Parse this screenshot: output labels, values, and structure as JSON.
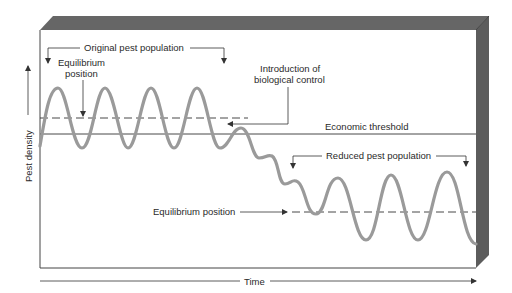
{
  "diagram": {
    "type": "conceptual line diagram",
    "axes": {
      "x_label": "Time",
      "y_label": "Pest density"
    },
    "labels": {
      "original_population": "Original pest population",
      "equilibrium_upper_line1": "Equilibrium",
      "equilibrium_upper_line2": "position",
      "introduction_line1": "Introduction of",
      "introduction_line2": "biological control",
      "economic_threshold": "Economic threshold",
      "reduced_population": "Reduced pest population",
      "equilibrium_lower": "Equilibrium position"
    },
    "lines": {
      "equilibrium_original_y": 118,
      "economic_threshold_y": 134,
      "equilibrium_reduced_y": 212
    },
    "colors": {
      "curve": "#9a9a9a",
      "frame_dark": "#5a5a5a",
      "frame_bevel": "#707070",
      "lines": "#333333"
    }
  }
}
